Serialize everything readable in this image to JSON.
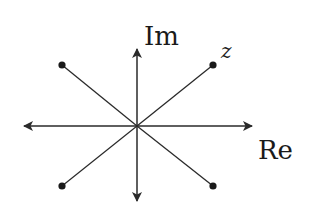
{
  "diagram": {
    "colors": {
      "stroke": "#2a2a2a",
      "text": "#1a1a1a",
      "background": "#ffffff"
    },
    "origin": {
      "x": 137,
      "y": 126
    },
    "axes": {
      "real": {
        "label": "Re",
        "from": {
          "x": 24,
          "y": 126
        },
        "to": {
          "x": 252,
          "y": 126
        }
      },
      "imaginary": {
        "label": "Im",
        "from": {
          "x": 137,
          "y": 201
        },
        "to": {
          "x": 137,
          "y": 49
        }
      }
    },
    "points": [
      {
        "name": "z",
        "label": "z",
        "x": 213,
        "y": 65
      },
      {
        "name": "upper-left",
        "label": "",
        "x": 62,
        "y": 65
      },
      {
        "name": "lower-left",
        "label": "",
        "x": 62,
        "y": 186
      },
      {
        "name": "lower-right",
        "label": "",
        "x": 213,
        "y": 186
      }
    ]
  }
}
